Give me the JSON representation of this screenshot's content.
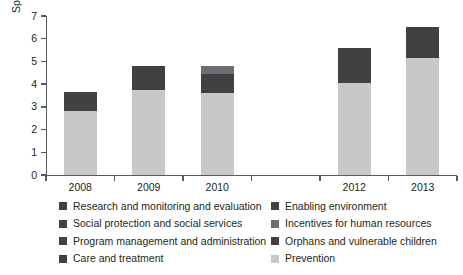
{
  "chart_data": {
    "type": "bar",
    "stacked": true,
    "title": "",
    "xlabel": "",
    "ylabel": "Spending (US$, millions)",
    "ylim": [
      0,
      7
    ],
    "yticks": [
      0,
      1,
      2,
      3,
      4,
      5,
      6,
      7
    ],
    "grid": false,
    "legend_position": "bottom",
    "categories": [
      "2008",
      "2009",
      "2010",
      "2011",
      "2012",
      "2013"
    ],
    "note": "2011 has an axis tick but no bar (no data plotted)",
    "series": [
      {
        "name": "Prevention",
        "color": "#c8c8c8",
        "values": [
          2.8,
          3.75,
          3.6,
          null,
          4.05,
          5.15
        ]
      },
      {
        "name": "Orphans and vulnerable children",
        "color": "#414042",
        "values": [
          0.85,
          1.05,
          0.85,
          null,
          1.55,
          1.35
        ]
      },
      {
        "name": "Incentives for human resources",
        "color": "#6d6e71",
        "values": [
          0,
          0,
          0.35,
          null,
          0,
          0
        ]
      }
    ],
    "bar_totals": [
      3.65,
      4.8,
      4.8,
      null,
      5.6,
      6.5
    ],
    "legend": [
      {
        "label": "Research and monitoring and evaluation",
        "color": "#414042"
      },
      {
        "label": "Social protection and social services",
        "color": "#414042"
      },
      {
        "label": "Program management and administration",
        "color": "#414042"
      },
      {
        "label": "Care and treatment",
        "color": "#414042"
      },
      {
        "label": "Enabling environment",
        "color": "#414042"
      },
      {
        "label": "Incentives for human resources",
        "color": "#6d6e71"
      },
      {
        "label": "Orphans and vulnerable children",
        "color": "#414042"
      },
      {
        "label": "Prevention",
        "color": "#c8c8c8"
      }
    ]
  }
}
